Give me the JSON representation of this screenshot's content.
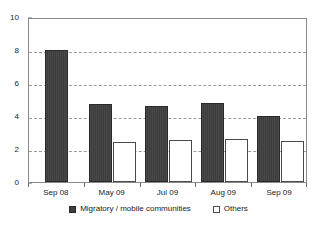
{
  "chart_data": {
    "type": "bar",
    "title": "",
    "xlabel": "",
    "ylabel": "",
    "categories": [
      "Sep 08",
      "May 09",
      "Jul 09",
      "Aug 09",
      "Sep 09"
    ],
    "series": [
      {
        "name": "Migratory / mobile communities",
        "swatch": "dark-filled-square",
        "color": "#3d3d3d",
        "values": [
          8.0,
          4.7,
          4.6,
          4.8,
          4.0
        ]
      },
      {
        "name": "Others",
        "swatch": "hollow-square",
        "color": "#ffffff",
        "values": [
          null,
          2.4,
          2.55,
          2.6,
          2.5
        ]
      }
    ],
    "ylim": [
      0,
      10
    ],
    "y_ticks": [
      0,
      2,
      4,
      6,
      8,
      10
    ],
    "y_tick_labels": [
      "0",
      "2",
      "4",
      "6",
      "8",
      "10"
    ],
    "gridlines": [
      2,
      4,
      6,
      8
    ],
    "grid": true,
    "grid_style": "dashed",
    "grid_color": "#9a9a9a",
    "legend_position": "bottom-center",
    "frame_color": "#8a8a8a",
    "background": "#ffffff"
  }
}
